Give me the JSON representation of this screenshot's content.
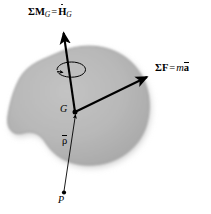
{
  "figure": {
    "domain": "Diagram",
    "background_color": "#ffffff",
    "body": {
      "name": "rigid-body-blob",
      "fill_color": "#b6b6b6",
      "edge_color": "#9a9a9a",
      "shadow_color": "#cfcfcf"
    },
    "labels": {
      "moment": {
        "sigma": "Σ",
        "vector": "M",
        "vector_subscript": "G",
        "equals": "=",
        "rhs_vector": "H",
        "rhs_subscript": "G",
        "rhs_accent": "dot",
        "plain_text": "ΣM_G = Ḡ_G"
      },
      "force": {
        "sigma": "Σ",
        "vector": "F",
        "equals": "=",
        "mass": "m",
        "accel": "a",
        "accel_accent": "overbar",
        "plain_text": "ΣF = mā"
      },
      "center_of_mass": {
        "text": "G",
        "description": "center of mass point label"
      },
      "position_vector": {
        "text": "ρ",
        "accent": "overbar",
        "plain_text": "ρ̄",
        "description": "position vector from P to G"
      },
      "reference_point": {
        "text": "P",
        "description": "arbitrary reference point"
      }
    },
    "vectors": {
      "moment_arrow": {
        "name": "moment-vector-arrow",
        "from": [
          75,
          112
        ],
        "to": [
          63,
          30
        ],
        "color": "#000000",
        "style": "solid-thick-arrow"
      },
      "force_arrow": {
        "name": "force-vector-arrow",
        "from": [
          75,
          112
        ],
        "to": [
          150,
          75
        ],
        "color": "#000000",
        "style": "solid-thick-arrow"
      },
      "position_arrow": {
        "name": "position-vector-arrow",
        "from": [
          64,
          196
        ],
        "to": [
          75,
          112
        ],
        "color": "#000000",
        "style": "solid-thin-arrow"
      },
      "spin_arrow": {
        "name": "spin-rotation-arrow",
        "center": [
          70,
          72
        ],
        "rx": 15,
        "ry": 5,
        "color": "#000000",
        "style": "elliptical-curved-arrow"
      }
    },
    "points": {
      "G": {
        "x": 75,
        "y": 112,
        "radius": 2.4,
        "color": "#000000"
      },
      "P": {
        "x": 64,
        "y": 193,
        "radius": 2.2,
        "color": "#000000"
      }
    }
  }
}
